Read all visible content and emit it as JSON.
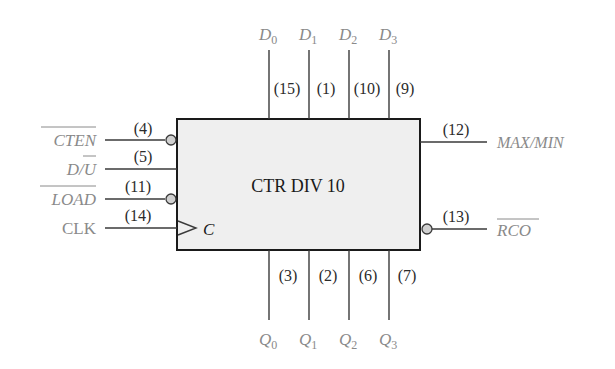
{
  "block": {
    "title": "CTR DIV 10",
    "clock_label": "C",
    "fill": "#efefef",
    "border": "#1a1a1a"
  },
  "left_inputs": [
    {
      "name": "CTEN",
      "overbar": true,
      "pin": "(4)",
      "inverted": true
    },
    {
      "name": "D/U",
      "display_main": "D/",
      "display_bar": "U",
      "pin": "(5)",
      "inverted": false
    },
    {
      "name": "LOAD",
      "overbar": true,
      "pin": "(11)",
      "inverted": true
    },
    {
      "name": "CLK",
      "overbar": false,
      "pin": "(14)",
      "inverted": false,
      "clock": true
    }
  ],
  "top_inputs": [
    {
      "base": "D",
      "sub": "0",
      "pin": "(15)"
    },
    {
      "base": "D",
      "sub": "1",
      "pin": "(1)"
    },
    {
      "base": "D",
      "sub": "2",
      "pin": "(10)"
    },
    {
      "base": "D",
      "sub": "3",
      "pin": "(9)"
    }
  ],
  "bottom_outputs": [
    {
      "base": "Q",
      "sub": "0",
      "pin": "(3)"
    },
    {
      "base": "Q",
      "sub": "1",
      "pin": "(2)"
    },
    {
      "base": "Q",
      "sub": "2",
      "pin": "(6)"
    },
    {
      "base": "Q",
      "sub": "3",
      "pin": "(7)"
    }
  ],
  "right_outputs": [
    {
      "name": "MAX/MIN",
      "overbar": false,
      "pin": "(12)",
      "inverted": false
    },
    {
      "name": "RCO",
      "overbar": true,
      "pin": "(13)",
      "inverted": true
    }
  ],
  "colors": {
    "label_gray": "#8a8a8a",
    "wire": "#3a3a3a",
    "text_dark": "#2b2b2b"
  }
}
